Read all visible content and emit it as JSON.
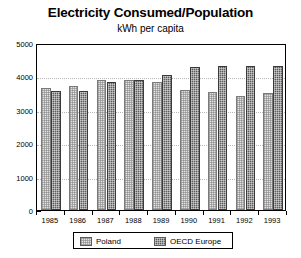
{
  "chart_data": {
    "type": "bar",
    "title": "Electricity Consumed/Population",
    "subtitle": "kWh per capita",
    "xlabel": "",
    "ylabel": "",
    "ylim": [
      0,
      5000
    ],
    "ytick_labels": [
      "0",
      "1000",
      "2000",
      "3000",
      "4000",
      "5000"
    ],
    "ytick_values": [
      0,
      1000,
      2000,
      3000,
      4000,
      5000
    ],
    "grid": true,
    "grid_axis": "y",
    "legend_position": "bottom",
    "categories": [
      "1985",
      "1986",
      "1987",
      "1988",
      "1989",
      "1990",
      "1991",
      "1992",
      "1993"
    ],
    "series": [
      {
        "name": "Poland",
        "color": "#e2e2e2",
        "pattern": "light-checker",
        "values": [
          3650,
          3700,
          3900,
          3900,
          3830,
          3600,
          3520,
          3420,
          3500
        ]
      },
      {
        "name": "OECD Europe",
        "color": "#5c5c5c",
        "pattern": "dark-checker",
        "values": [
          3570,
          3550,
          3830,
          3880,
          4030,
          4270,
          4300,
          4300,
          4320
        ]
      }
    ]
  },
  "legend": {
    "entries": [
      {
        "label": "Poland"
      },
      {
        "label": "OECD Europe"
      }
    ]
  }
}
